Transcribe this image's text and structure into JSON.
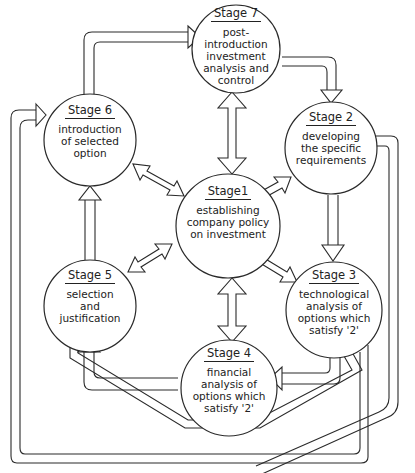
{
  "diagram": {
    "type": "cyclic process flow",
    "stroke_color": "#2a2a2a",
    "background_color": "#ffffff",
    "center_stage": "stage1",
    "stages": {
      "stage1": {
        "title": "Stage1",
        "description": "establishing\ncompany policy\non investment"
      },
      "stage2": {
        "title": "Stage 2",
        "description": "developing\nthe specific\nrequirements"
      },
      "stage3": {
        "title": "Stage 3",
        "description": "technological\nanalysis of\noptions which\nsatisfy '2'"
      },
      "stage4": {
        "title": "Stage 4",
        "description": "financial\nanalysis of\noptions which\nsatisfy '2'"
      },
      "stage5": {
        "title": "Stage 5",
        "description": "selection\nand\njustification"
      },
      "stage6": {
        "title": "Stage 6",
        "description": "introduction\nof selected\noption"
      },
      "stage7": {
        "title": "Stage 7",
        "description": "post-\nintroduction\ninvestment\nanalysis and\ncontrol"
      }
    },
    "connections": [
      {
        "from": "stage1",
        "to": "stage7",
        "type": "bidirectional"
      },
      {
        "from": "stage1",
        "to": "stage2",
        "type": "bidirectional"
      },
      {
        "from": "stage1",
        "to": "stage3",
        "type": "bidirectional"
      },
      {
        "from": "stage1",
        "to": "stage4",
        "type": "bidirectional"
      },
      {
        "from": "stage1",
        "to": "stage5",
        "type": "bidirectional"
      },
      {
        "from": "stage1",
        "to": "stage6",
        "type": "bidirectional"
      },
      {
        "from": "stage7",
        "to": "stage2",
        "type": "directed"
      },
      {
        "from": "stage2",
        "to": "stage3",
        "type": "directed"
      },
      {
        "from": "stage3",
        "to": "stage4",
        "type": "directed"
      },
      {
        "from": "stage4",
        "to": "stage5",
        "type": "directed"
      },
      {
        "from": "stage3",
        "to": "stage5",
        "type": "directed"
      },
      {
        "from": "stage2",
        "to": "stage5",
        "type": "directed"
      },
      {
        "from": "stage5",
        "to": "stage6",
        "type": "directed"
      },
      {
        "from": "stage6",
        "to": "stage7",
        "type": "directed"
      },
      {
        "from": "stage3",
        "to": "stage6",
        "type": "directed",
        "note": "outer loop"
      }
    ]
  }
}
